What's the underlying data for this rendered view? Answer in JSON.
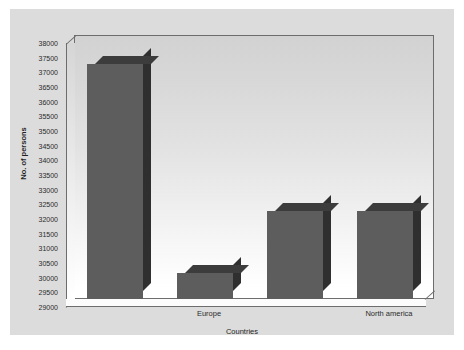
{
  "chart_data": {
    "type": "bar",
    "title": "",
    "subtitle": "",
    "xlabel": "Countries",
    "ylabel": "No. of persons",
    "categories": [
      "",
      "Europe",
      "",
      "North america"
    ],
    "visible_tick_labels": [
      "Europe",
      "North america"
    ],
    "values": [
      37000,
      29900,
      32000,
      32000
    ],
    "ylim": [
      29000,
      38000
    ],
    "ytick_step": 500,
    "yticks": [
      "38000",
      "37500",
      "37000",
      "36500",
      "36000",
      "35500",
      "35000",
      "34500",
      "34000",
      "33500",
      "33000",
      "32500",
      "32000",
      "31500",
      "31000",
      "30500",
      "30000",
      "29500",
      "29000"
    ],
    "grid": false,
    "legend": "none",
    "style": "3d-bar",
    "series": [
      {
        "name": "No. of persons",
        "values": [
          37000,
          29900,
          32000,
          32000
        ],
        "color": "#5d5d5d"
      }
    ],
    "colors": {
      "bar_front": "#5d5d5d",
      "bar_top": "#3c3c3c",
      "bar_side": "#2f2f2f",
      "plot_border": "#6d6d6d",
      "canvas_background": "#dcdcdc",
      "plot_background_top": "#d2d2d2",
      "plot_background_bottom": "#ffffff",
      "page_background": "#ffffff",
      "text": "#2b2b2b"
    }
  }
}
